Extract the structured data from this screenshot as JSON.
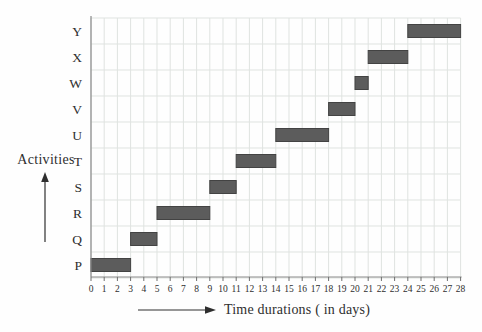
{
  "chart_data": {
    "type": "gantt",
    "title": "",
    "xlabel": "Time durations ( in days)",
    "ylabel": "Activities",
    "xlim": [
      0,
      28
    ],
    "x_tick_step": 1,
    "x_ticks": [
      0,
      1,
      2,
      3,
      4,
      5,
      6,
      7,
      8,
      9,
      10,
      11,
      12,
      13,
      14,
      15,
      16,
      17,
      18,
      19,
      20,
      21,
      22,
      23,
      24,
      25,
      26,
      27,
      28
    ],
    "grid": true,
    "legend": false,
    "categories": [
      "P",
      "Q",
      "R",
      "S",
      "T",
      "U",
      "V",
      "W",
      "X",
      "Y"
    ],
    "bars": [
      {
        "activity": "P",
        "start": 0,
        "end": 3,
        "duration": 3
      },
      {
        "activity": "Q",
        "start": 3,
        "end": 5,
        "duration": 2
      },
      {
        "activity": "R",
        "start": 5,
        "end": 9,
        "duration": 4
      },
      {
        "activity": "S",
        "start": 9,
        "end": 11,
        "duration": 2
      },
      {
        "activity": "T",
        "start": 11,
        "end": 14,
        "duration": 3
      },
      {
        "activity": "U",
        "start": 14,
        "end": 18,
        "duration": 4
      },
      {
        "activity": "V",
        "start": 18,
        "end": 20,
        "duration": 2
      },
      {
        "activity": "W",
        "start": 20,
        "end": 21,
        "duration": 1
      },
      {
        "activity": "X",
        "start": 21,
        "end": 24,
        "duration": 3
      },
      {
        "activity": "Y",
        "start": 24,
        "end": 28,
        "duration": 4
      }
    ],
    "colors": {
      "bar": "#5c5c5c",
      "bar_border": "#434343",
      "grid": "#dfe3e0",
      "axis": "#8a8a8a",
      "tick": "#6f6f6f",
      "text": "#2e2e2e",
      "background": "#fefefe",
      "arrow": "#2e2e2e"
    }
  }
}
